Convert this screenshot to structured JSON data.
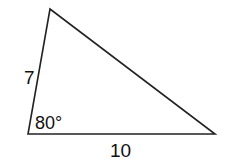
{
  "figure": {
    "type": "triangle",
    "vertices": {
      "top": [
        50,
        9
      ],
      "bottom_left": [
        28,
        134
      ],
      "bottom_right": [
        215,
        134
      ]
    },
    "stroke_color": "#222222",
    "background": "#ffffff"
  },
  "labels": {
    "left_side": "7",
    "angle": "80°",
    "bottom_side": "10"
  }
}
